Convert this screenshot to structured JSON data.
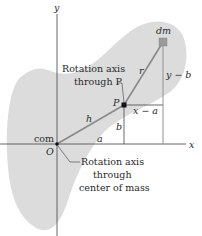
{
  "figure": {
    "type": "parallel-axis theorem diagram",
    "colors": {
      "body_fill": "#dcdcdc",
      "axis_line": "#555555",
      "construction_line": "#9a9a9a",
      "point": "#111111",
      "mass_element": "#9a9a9a",
      "text": "#2a2a2a"
    },
    "axes": {
      "y_label": "y",
      "x_label": "x"
    },
    "points": {
      "origin_label": "O",
      "com_label": "com",
      "pivot_label": "P",
      "mass_element_label": "dm"
    },
    "segments": {
      "h_label": "h",
      "r_label": "r",
      "a_label": "a",
      "b_label": "b",
      "x_minus_a_label": "x − a",
      "y_minus_b_label": "y − b"
    },
    "callouts": {
      "pivot_axis": {
        "line1": "Rotation axis",
        "line2": "through P"
      },
      "com_axis": {
        "line1": "Rotation axis",
        "line2": "through",
        "line3": "center of mass"
      }
    }
  }
}
